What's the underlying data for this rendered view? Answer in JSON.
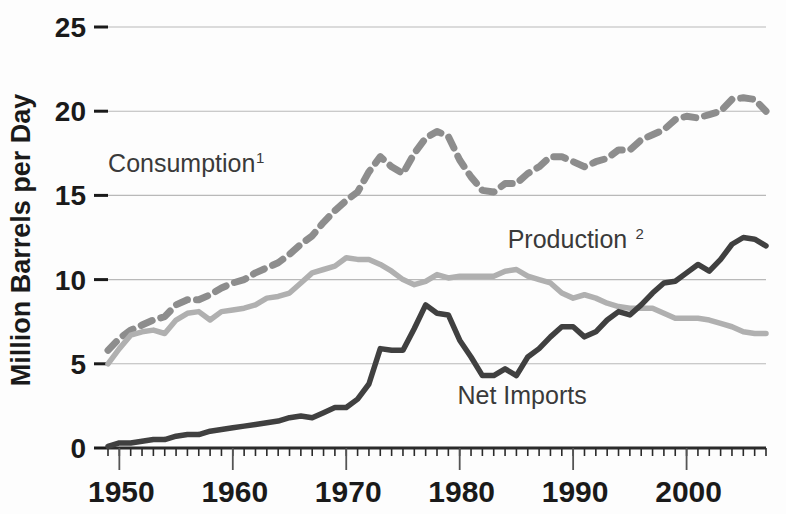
{
  "chart_data": {
    "type": "line",
    "title": "",
    "subtitle": "",
    "xlabel": "",
    "ylabel": "Million Barrels per Day",
    "xlim": [
      1949,
      2007
    ],
    "ylim": [
      0,
      25
    ],
    "grid": true,
    "legend_position": "inline-annotations",
    "y_ticks": [
      0,
      5,
      10,
      15,
      20,
      25
    ],
    "y_tick_labels": [
      "0",
      "5",
      "10",
      "15",
      "20",
      "25"
    ],
    "x_ticks": [
      1950,
      1960,
      1970,
      1980,
      1990,
      2000
    ],
    "x_tick_labels": [
      "1950",
      "1960",
      "1970",
      "1980",
      "1990",
      "2000"
    ],
    "x_minor_tick_interval": 1,
    "x": [
      1949,
      1950,
      1951,
      1952,
      1953,
      1954,
      1955,
      1956,
      1957,
      1958,
      1959,
      1960,
      1961,
      1962,
      1963,
      1964,
      1965,
      1966,
      1967,
      1968,
      1969,
      1970,
      1971,
      1972,
      1973,
      1974,
      1975,
      1976,
      1977,
      1978,
      1979,
      1980,
      1981,
      1982,
      1983,
      1984,
      1985,
      1986,
      1987,
      1988,
      1989,
      1990,
      1991,
      1992,
      1993,
      1994,
      1995,
      1996,
      1997,
      1998,
      1999,
      2000,
      2001,
      2002,
      2003,
      2004,
      2005,
      2006,
      2007
    ],
    "series": [
      {
        "name": "Consumption",
        "superscript": "1",
        "style": "dashed",
        "color": "#8d8d8d",
        "label_x": 1955.5,
        "label_y": 16.4,
        "values": [
          5.8,
          6.5,
          7.0,
          7.3,
          7.6,
          7.8,
          8.5,
          8.8,
          8.8,
          9.1,
          9.5,
          9.8,
          10.0,
          10.4,
          10.7,
          11.0,
          11.5,
          12.1,
          12.6,
          13.4,
          14.1,
          14.7,
          15.2,
          16.4,
          17.3,
          16.7,
          16.3,
          17.5,
          18.4,
          18.8,
          18.5,
          17.1,
          16.1,
          15.3,
          15.2,
          15.7,
          15.7,
          16.3,
          16.7,
          17.3,
          17.3,
          17.0,
          16.7,
          17.0,
          17.2,
          17.7,
          17.7,
          18.3,
          18.6,
          18.9,
          19.5,
          19.7,
          19.6,
          19.8,
          20.0,
          20.7,
          20.8,
          20.7,
          20.0
        ]
      },
      {
        "name": "Production",
        "superscript": "2",
        "style": "solid",
        "color": "#b0b0b0",
        "label_x": 1989.5,
        "label_y": 11.9,
        "values": [
          5.0,
          5.9,
          6.7,
          6.9,
          7.0,
          6.8,
          7.6,
          8.0,
          8.1,
          7.6,
          8.1,
          8.2,
          8.3,
          8.5,
          8.9,
          9.0,
          9.2,
          9.8,
          10.4,
          10.6,
          10.8,
          11.3,
          11.2,
          11.2,
          10.9,
          10.5,
          10.0,
          9.7,
          9.9,
          10.3,
          10.1,
          10.2,
          10.2,
          10.2,
          10.2,
          10.5,
          10.6,
          10.2,
          10.0,
          9.8,
          9.2,
          8.9,
          9.1,
          8.9,
          8.6,
          8.4,
          8.3,
          8.3,
          8.3,
          8.0,
          7.7,
          7.7,
          7.7,
          7.6,
          7.4,
          7.2,
          6.9,
          6.8,
          6.8
        ]
      },
      {
        "name": "Net Imports",
        "superscript": "",
        "style": "solid",
        "color": "#404040",
        "label_x": 1985.5,
        "label_y": 2.6,
        "values": [
          0.1,
          0.3,
          0.3,
          0.4,
          0.5,
          0.5,
          0.7,
          0.8,
          0.8,
          1.0,
          1.1,
          1.2,
          1.3,
          1.4,
          1.5,
          1.6,
          1.8,
          1.9,
          1.8,
          2.1,
          2.4,
          2.4,
          2.9,
          3.8,
          5.9,
          5.8,
          5.8,
          7.1,
          8.5,
          8.0,
          7.9,
          6.4,
          5.4,
          4.3,
          4.3,
          4.7,
          4.3,
          5.4,
          5.9,
          6.6,
          7.2,
          7.2,
          6.6,
          6.9,
          7.6,
          8.1,
          7.9,
          8.5,
          9.2,
          9.8,
          9.9,
          10.4,
          10.9,
          10.5,
          11.2,
          12.1,
          12.5,
          12.4,
          12.0
        ]
      }
    ]
  }
}
